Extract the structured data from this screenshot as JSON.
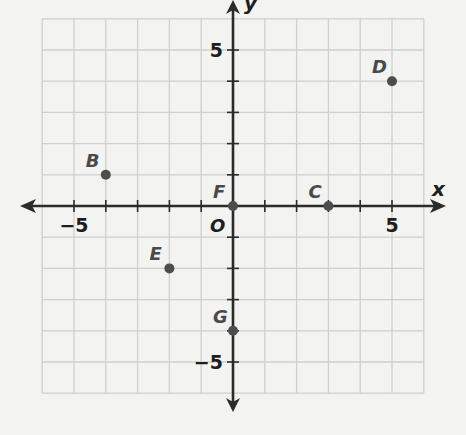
{
  "chart_data": {
    "type": "scatter",
    "title": "",
    "xlabel": "x",
    "ylabel": "y",
    "origin_label": "O",
    "xlim": [
      -6,
      6
    ],
    "ylim": [
      -6,
      6
    ],
    "grid": true,
    "x_tick_labels": [
      {
        "value": -5,
        "text": "−5"
      },
      {
        "value": 5,
        "text": "5"
      }
    ],
    "y_tick_labels": [
      {
        "value": 5,
        "text": "5"
      },
      {
        "value": -5,
        "text": "−5"
      }
    ],
    "points": [
      {
        "label": "B",
        "x": -4,
        "y": 1
      },
      {
        "label": "D",
        "x": 5,
        "y": 4
      },
      {
        "label": "F",
        "x": 0,
        "y": 0
      },
      {
        "label": "C",
        "x": 3,
        "y": 0
      },
      {
        "label": "E",
        "x": -2,
        "y": -2
      },
      {
        "label": "G",
        "x": 0,
        "y": -4
      }
    ],
    "colors": {
      "background": "#f3f3f1",
      "grid": "#cfcfcc",
      "axis": "#2b2b2b",
      "point": "#4d4d4d",
      "point_label": "#4a4a4a"
    }
  }
}
